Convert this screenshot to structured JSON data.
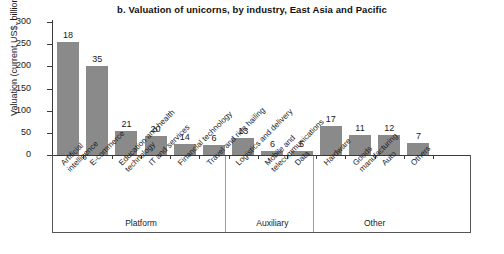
{
  "chart_data": {
    "type": "bar",
    "title": "b. Valuation of unicorns, by industry, East Asia and Pacific",
    "xlabel": "",
    "ylabel": "Valuation (current US$, billions)",
    "ylim": [
      0,
      300
    ],
    "yticks": [
      0,
      50,
      100,
      150,
      200,
      250,
      300
    ],
    "grid": false,
    "legend": null,
    "bar_color": "#8a8a8a",
    "categories": [
      "Artificial intelligence",
      "E-commerce",
      "Education and health technology",
      "IT and services",
      "Financial technology",
      "Travel and ride hailing",
      "Logistics and delivery",
      "Mobile and telecommunications",
      "Data",
      "Hardware",
      "Goods manufacturing",
      "Auto",
      "Others"
    ],
    "category_lines": [
      [
        "Artificial",
        "intelligence"
      ],
      [
        "E-commerce"
      ],
      [
        "Education and health",
        "technology"
      ],
      [
        "IT and services"
      ],
      [
        "Financial technology"
      ],
      [
        "Travel and ride hailing"
      ],
      [
        "Logistics and delivery"
      ],
      [
        "Mobile and",
        "telecommunications"
      ],
      [
        "Data"
      ],
      [
        "Hardware"
      ],
      [
        "Goods",
        "manufacturing"
      ],
      [
        "Auto"
      ],
      [
        "Others"
      ]
    ],
    "values": [
      255,
      200,
      55,
      42,
      25,
      22,
      38,
      10,
      8,
      65,
      45,
      45,
      28
    ],
    "data_labels": [
      18,
      35,
      21,
      20,
      14,
      6,
      13,
      6,
      5,
      17,
      11,
      12,
      7
    ],
    "data_label_meaning": "number of unicorns",
    "groups": [
      {
        "label": "Platform",
        "start": 0,
        "end": 5
      },
      {
        "label": "Auxiliary",
        "start": 6,
        "end": 8
      },
      {
        "label": "Other",
        "start": 9,
        "end": 12
      }
    ]
  }
}
